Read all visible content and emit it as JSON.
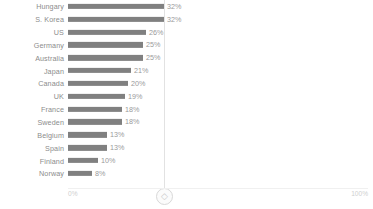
{
  "chart_data": {
    "type": "bar",
    "orientation": "horizontal",
    "title": "",
    "subtitle": "",
    "xlabel": "",
    "ylabel": "",
    "xlim": [
      0,
      100
    ],
    "grid": false,
    "legend": null,
    "value_suffix": "%",
    "categories": [
      "Hungary",
      "S. Korea",
      "US",
      "Germany",
      "Australia",
      "Japan",
      "Canada",
      "UK",
      "France",
      "Sweden",
      "Belgium",
      "Spain",
      "Finland",
      "Norway"
    ],
    "values": [
      32,
      32,
      26,
      25,
      25,
      21,
      20,
      19,
      18,
      18,
      13,
      13,
      10,
      8
    ],
    "value_labels": [
      "32%",
      "32%",
      "26%",
      "25%",
      "25%",
      "21%",
      "20%",
      "19%",
      "18%",
      "18%",
      "13%",
      "13%",
      "10%",
      "8%"
    ],
    "axis_ticks": [
      {
        "value": 0,
        "label": "0%"
      },
      {
        "value": 100,
        "label": "100%"
      }
    ],
    "annotations": [
      {
        "kind": "vertical-reference-line",
        "value": 32,
        "label": ""
      }
    ],
    "colors": {
      "bar": "#808080",
      "category_label": "#8c8c8c",
      "value_label": "#9a9a9a",
      "reference_line": "#e2e2e2",
      "axis_line": "#f0f0f0",
      "axis_tick_label": "#cfcfcf",
      "background": "#ffffff"
    }
  },
  "handle": {
    "icon": "diamond-handle-icon",
    "glyph": "◇"
  },
  "axis": {
    "min_label": "0%",
    "max_label": "100%"
  }
}
